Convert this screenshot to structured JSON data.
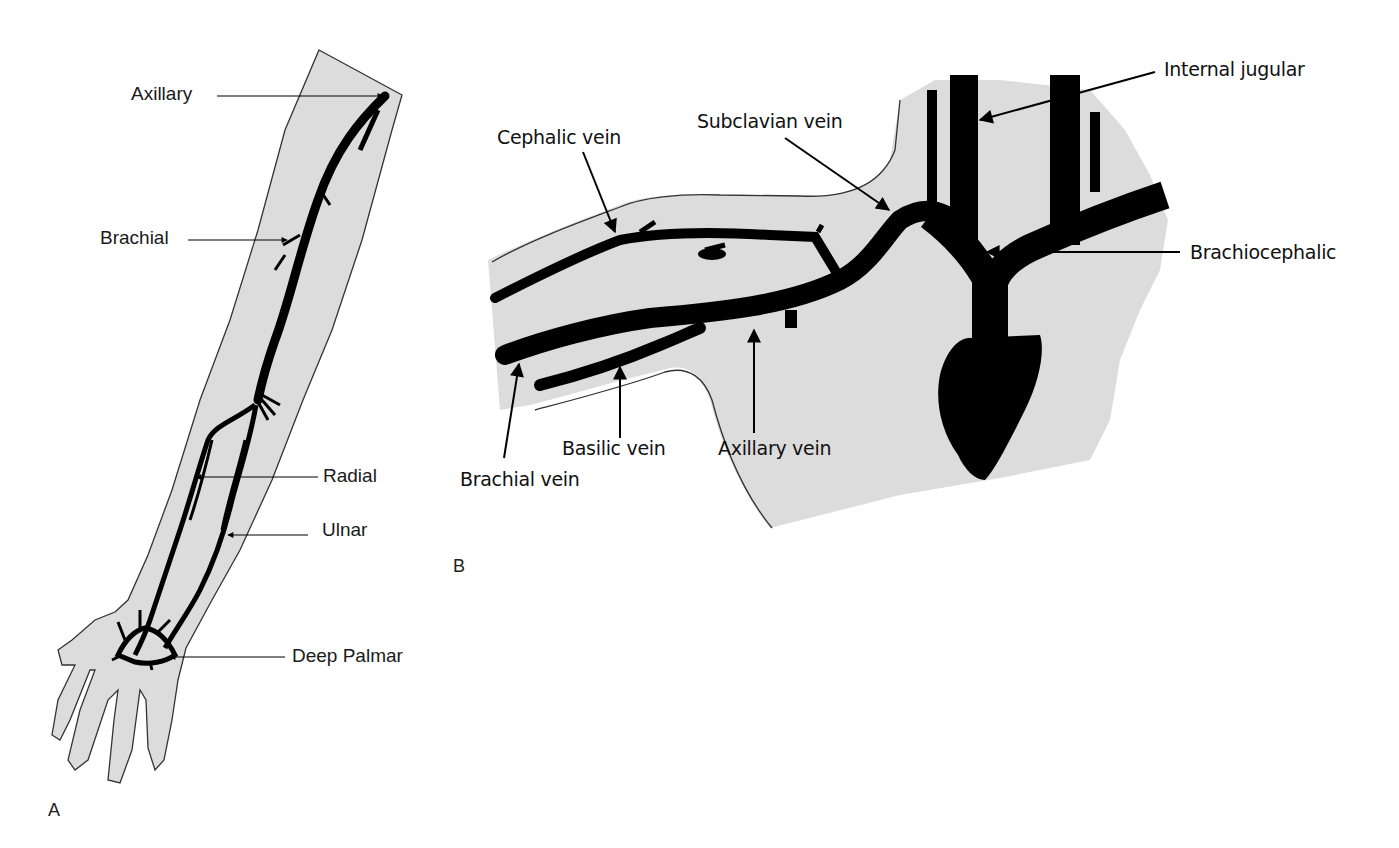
{
  "figure": {
    "colors": {
      "tissue": "#dcdcdc",
      "vessel": "#000000",
      "outline": "#333333",
      "background": "#ffffff"
    },
    "panel_a": {
      "letter": "A",
      "title": "Upper limb arteries",
      "labels": {
        "axillary": "Axillary",
        "brachial": "Brachial",
        "radial": "Radial",
        "ulnar": "Ulnar",
        "deep_palmar": "Deep Palmar"
      }
    },
    "panel_b": {
      "letter": "B",
      "title": "Upper limb and central veins",
      "labels": {
        "cephalic": "Cephalic vein",
        "subclavian": "Subclavian vein",
        "internal_jugular": "Internal jugular",
        "brachiocephalic": "Brachiocephalic",
        "brachial": "Brachial vein",
        "basilic": "Basilic vein",
        "axillary": "Axillary vein"
      }
    }
  }
}
